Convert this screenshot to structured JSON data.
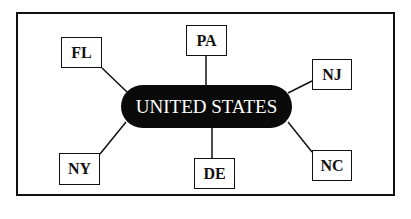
{
  "diagram": {
    "type": "hub-and-spoke",
    "center": {
      "label": "UNITED STATES"
    },
    "nodes": [
      {
        "id": "pa",
        "label": "PA"
      },
      {
        "id": "fl",
        "label": "FL"
      },
      {
        "id": "nj",
        "label": "NJ"
      },
      {
        "id": "ny",
        "label": "NY"
      },
      {
        "id": "de",
        "label": "DE"
      },
      {
        "id": "nc",
        "label": "NC"
      }
    ],
    "colors": {
      "center_fill": "#0a0a0a",
      "center_text": "#ffffff",
      "stroke": "#111111",
      "background": "#ffffff"
    }
  }
}
